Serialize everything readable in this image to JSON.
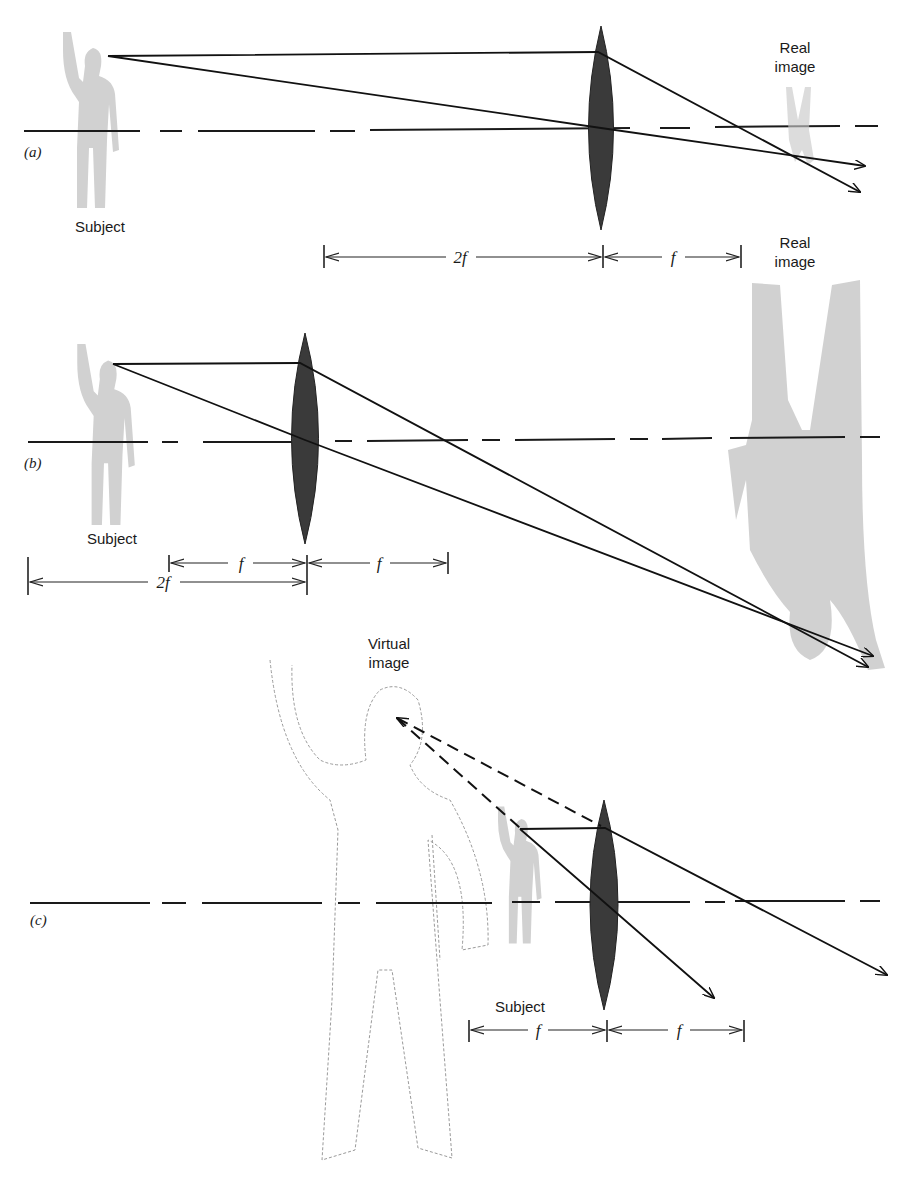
{
  "figure": {
    "panels": [
      {
        "id": "a",
        "panel_label": "(a)",
        "subject_label": "Subject",
        "image_label_line1": "Real",
        "image_label_line2": "image",
        "dimensions": [
          {
            "label": "2f"
          },
          {
            "label": "f"
          }
        ]
      },
      {
        "id": "b",
        "panel_label": "(b)",
        "subject_label": "Subject",
        "image_label_line1": "Real",
        "image_label_line2": "image",
        "dimensions": [
          {
            "label": "f"
          },
          {
            "label": "f"
          },
          {
            "label": "2f"
          }
        ]
      },
      {
        "id": "c",
        "panel_label": "(c)",
        "subject_label": "Subject",
        "image_label_line1": "Virtual",
        "image_label_line2": "image",
        "dimensions": [
          {
            "label": "f"
          },
          {
            "label": "f"
          }
        ]
      }
    ],
    "colors": {
      "lens": "#3a3a3a",
      "subject": "#c9c9c9",
      "rays": "#111111",
      "virtual_outline": "#9a9a9a"
    }
  }
}
